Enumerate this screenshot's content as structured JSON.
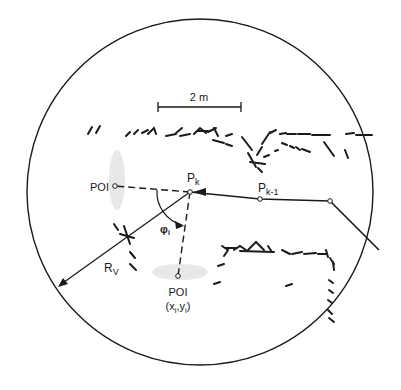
{
  "diagram": {
    "type": "robot-navigation-visibility",
    "colors": {
      "ink": "#1a1a1a",
      "background": "#ffffff",
      "smudge": "#e6e6e6"
    },
    "visibility_circle": {
      "cx": 200,
      "cy": 192,
      "r": 173
    },
    "scale_bar": {
      "label": "2 m",
      "x1": 158,
      "x2": 241,
      "y": 107
    },
    "points": {
      "pk": {
        "label": "P",
        "sub": "k",
        "x": 190,
        "y": 192
      },
      "pk_minus_1": {
        "label": "P",
        "sub": "k-1",
        "x": 260,
        "y": 199
      },
      "path_corner": {
        "x": 330,
        "y": 201
      },
      "poi_left": {
        "label": "POI",
        "x": 115,
        "y": 186
      },
      "poi_bottom": {
        "label": "POI",
        "coords_label": "(x",
        "coords_i1": "i",
        "coords_mid": ",y",
        "coords_i2": "i",
        "coords_end": ")",
        "x": 178,
        "y": 276
      }
    },
    "angle": {
      "label": "φ",
      "sub": "i"
    },
    "radius": {
      "label": "R",
      "sub": "V"
    }
  }
}
